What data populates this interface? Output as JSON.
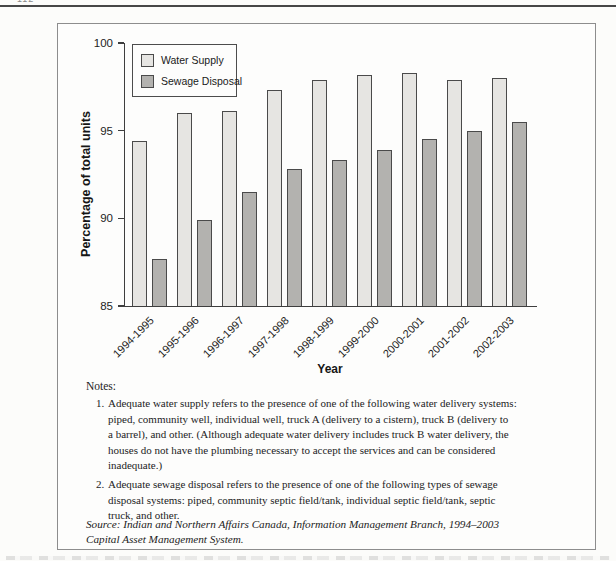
{
  "page": {
    "header_fragment": "112"
  },
  "chart_data": {
    "type": "bar",
    "title": "",
    "categories": [
      "1994-1995",
      "1995-1996",
      "1996-1997",
      "1997-1998",
      "1998-1999",
      "1999-2000",
      "2000-2001",
      "2001-2002",
      "2002-2003"
    ],
    "series": [
      {
        "name": "Water Supply",
        "color": "#e6e5e2",
        "values": [
          94.4,
          96.0,
          96.1,
          97.3,
          97.9,
          98.2,
          98.3,
          97.9,
          98.0
        ]
      },
      {
        "name": "Sewage Disposal",
        "color": "#b3b2af",
        "values": [
          87.7,
          89.9,
          91.5,
          92.8,
          93.3,
          93.9,
          94.5,
          95.0,
          95.5
        ]
      }
    ],
    "xlabel": "Year",
    "ylabel": "Percentage of total units",
    "ylim": [
      85,
      100
    ],
    "yticks": [
      100,
      95,
      90,
      85
    ],
    "grid": false,
    "legend_position": "top-left",
    "axis_color": "#3e3e3e"
  },
  "notes": {
    "heading": "Notes:",
    "items": [
      {
        "number": "1.",
        "text": "Adequate water supply refers to the presence of one of the following water delivery systems:\npiped, community well, individual well, truck A (delivery to a cistern), truck B (delivery to\na barrel), and other. (Although adequate water delivery includes truck B water delivery, the\nhouses do not have the plumbing necessary to accept the services and can be considered\ninadequate.)"
      },
      {
        "number": "2.",
        "text": "Adequate sewage disposal refers to the presence of one of the following types of sewage\ndisposal systems: piped, community septic field/tank, individual septic field/tank, septic\ntruck, and other."
      }
    ],
    "source": "Source: Indian and Northern Affairs Canada, Information Management Branch, 1994–2003\nCapital Asset Management System."
  }
}
